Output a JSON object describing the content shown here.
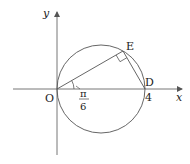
{
  "figure": {
    "type": "geometry",
    "axes": {
      "x_label": "x",
      "y_label": "y"
    },
    "points": {
      "origin": {
        "label": "O"
      },
      "D": {
        "label": "D",
        "value_label": "4"
      },
      "E": {
        "label": "E"
      }
    },
    "angle": {
      "numerator": "π",
      "denominator": "6"
    },
    "colors": {
      "stroke": "#555555",
      "text": "#222222"
    }
  }
}
